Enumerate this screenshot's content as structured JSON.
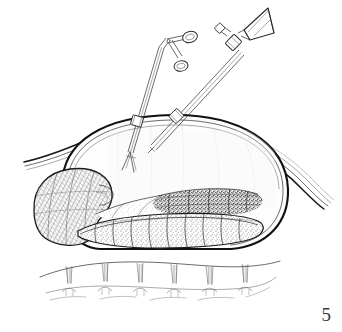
{
  "figure": {
    "number_label": "5",
    "caption": "",
    "background_color": "#ffffff",
    "ink_color": "#1a1a1a",
    "width": 342,
    "height": 332,
    "medium": "pen-and-ink line drawing with crosshatch and stipple shading",
    "parts": [
      {
        "id": "abdominal-cavity",
        "label": "Insufflated abdominal cavity dome",
        "description": "Large domed outline spanning the mid-frame, drawn with a bold outer contour and a thin parallel inner contour"
      },
      {
        "id": "retracted-tissue-left",
        "label": "Retracted tissue flap, left",
        "description": "Thin sweeping curved lines exiting the dome toward the left margin"
      },
      {
        "id": "retracted-tissue-right",
        "label": "Retracted tissue flap, right",
        "description": "Thin sweeping curved lines exiting the dome toward the right margin"
      },
      {
        "id": "shaded-organ-lobe",
        "label": "Shaded organ lobe",
        "description": "Rounded lobe at the lower left of the cavity rendered with dense crosshatching"
      },
      {
        "id": "lobulated-mass",
        "label": "Lobulated textured mass",
        "description": "Elongated stippled and granular tissue mass lying along the floor of the cavity"
      },
      {
        "id": "sutured-tissue-band",
        "label": "Sutured tissue band",
        "description": "Separate wavy band beneath the cavity showing six evenly spaced suture or ligature marks"
      }
    ],
    "instruments": [
      {
        "id": "ring-handle-instrument",
        "label": "Ring-handled grasping forceps",
        "handle_type": "finger-ring handle",
        "tip_type": "open jaws",
        "entry_port": "trocar collar",
        "angle_description": "enters from upper left, tip open inside the cavity"
      },
      {
        "id": "trumpet-valve-instrument",
        "label": "Trumpet-valve suction cannula",
        "handle_type": "funnel / trumpet end with side port",
        "tip_type": "blunt cannula",
        "entry_port": "trocar collar",
        "angle_description": "enters from upper right, tip directed into the cavity"
      }
    ]
  }
}
